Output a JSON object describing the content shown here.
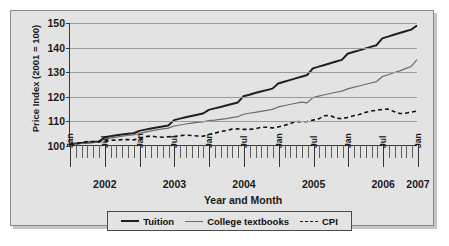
{
  "chart_data": {
    "type": "line",
    "title": "",
    "xlabel": "Year and Month",
    "ylabel": "Price Index (2001 = 100)",
    "ylim": [
      100,
      150
    ],
    "yticks": [
      100,
      110,
      120,
      130,
      140,
      150
    ],
    "grid": true,
    "legend_position": "bottom",
    "x_year_labels": [
      "2002",
      "2003",
      "2004",
      "2005",
      "2006",
      "2007"
    ],
    "x_month_major_labels": [
      "Jan",
      "Jul",
      "Jan",
      "Jul",
      "Jan",
      "Jul",
      "Jan",
      "Jul",
      "Jan",
      "Jul",
      "Jan"
    ],
    "x": [
      "Jan 2002",
      "Feb 2002",
      "Mar 2002",
      "Apr 2002",
      "May 2002",
      "Jun 2002",
      "Jul 2002",
      "Aug 2002",
      "Sep 2002",
      "Oct 2002",
      "Nov 2002",
      "Dec 2002",
      "Jan 2003",
      "Feb 2003",
      "Mar 2003",
      "Apr 2003",
      "May 2003",
      "Jun 2003",
      "Jul 2003",
      "Aug 2003",
      "Sep 2003",
      "Oct 2003",
      "Nov 2003",
      "Dec 2003",
      "Jan 2004",
      "Feb 2004",
      "Mar 2004",
      "Apr 2004",
      "May 2004",
      "Jun 2004",
      "Jul 2004",
      "Aug 2004",
      "Sep 2004",
      "Oct 2004",
      "Nov 2004",
      "Dec 2004",
      "Jan 2005",
      "Feb 2005",
      "Mar 2005",
      "Apr 2005",
      "May 2005",
      "Jun 2005",
      "Jul 2005",
      "Aug 2005",
      "Sep 2005",
      "Oct 2005",
      "Nov 2005",
      "Dec 2005",
      "Jan 2006",
      "Feb 2006",
      "Mar 2006",
      "Apr 2006",
      "May 2006",
      "Jun 2006",
      "Jul 2006",
      "Aug 2006",
      "Sep 2006",
      "Oct 2006",
      "Nov 2006",
      "Dec 2006",
      "Jan 2007"
    ],
    "series": [
      {
        "name": "Tuition",
        "style": "solid-thick",
        "color": "#1f1f1f",
        "values": [
          100.3,
          100.6,
          100.8,
          101.0,
          101.2,
          101.4,
          103.2,
          103.6,
          104.0,
          104.3,
          104.6,
          104.8,
          105.8,
          106.3,
          106.8,
          107.2,
          107.6,
          108.0,
          110.2,
          110.8,
          111.4,
          111.9,
          112.4,
          112.9,
          114.4,
          115.0,
          115.6,
          116.2,
          116.8,
          117.4,
          120.0,
          120.6,
          121.3,
          121.9,
          122.5,
          123.1,
          125.2,
          125.9,
          126.6,
          127.3,
          128.0,
          128.7,
          131.4,
          132.1,
          132.8,
          133.5,
          134.2,
          134.9,
          137.4,
          138.1,
          138.8,
          139.5,
          140.2,
          140.9,
          143.7,
          144.4,
          145.2,
          145.9,
          146.6,
          147.3,
          149.0
        ]
      },
      {
        "name": "College textbooks",
        "style": "solid-thin",
        "color": "#6b6b6b",
        "values": [
          100.2,
          100.4,
          100.6,
          100.8,
          101.0,
          101.2,
          102.4,
          102.8,
          103.2,
          103.6,
          103.9,
          104.1,
          104.8,
          105.3,
          105.8,
          106.2,
          106.6,
          106.9,
          107.8,
          108.2,
          108.6,
          109.0,
          109.3,
          109.5,
          110.0,
          110.2,
          110.5,
          110.8,
          111.2,
          111.6,
          112.6,
          113.0,
          113.4,
          113.8,
          114.2,
          114.6,
          115.6,
          116.1,
          116.6,
          117.1,
          117.6,
          117.3,
          119.4,
          120.0,
          120.6,
          121.1,
          121.6,
          122.1,
          123.0,
          123.6,
          124.2,
          124.8,
          125.4,
          126.0,
          128.0,
          128.8,
          129.6,
          130.4,
          131.3,
          132.2,
          135.0
        ]
      },
      {
        "name": "CPI",
        "style": "dashed",
        "color": "#111111",
        "values": [
          100.2,
          100.5,
          101.0,
          101.4,
          101.4,
          101.4,
          101.6,
          101.9,
          102.0,
          102.2,
          102.2,
          102.1,
          102.6,
          103.4,
          103.7,
          103.3,
          103.2,
          103.4,
          103.5,
          103.8,
          104.0,
          103.9,
          103.7,
          103.6,
          104.3,
          104.8,
          105.5,
          105.9,
          106.5,
          106.6,
          106.4,
          106.4,
          106.6,
          107.2,
          107.3,
          107.0,
          107.4,
          108.0,
          108.7,
          109.6,
          109.5,
          109.6,
          110.2,
          110.7,
          112.0,
          112.1,
          111.0,
          110.8,
          111.3,
          112.0,
          112.5,
          113.3,
          113.9,
          114.2,
          114.6,
          114.7,
          113.7,
          112.9,
          113.0,
          113.5,
          113.9
        ]
      }
    ]
  },
  "legend": {
    "items": [
      {
        "label": "Tuition"
      },
      {
        "label": "College textbooks"
      },
      {
        "label": "CPI"
      }
    ]
  }
}
